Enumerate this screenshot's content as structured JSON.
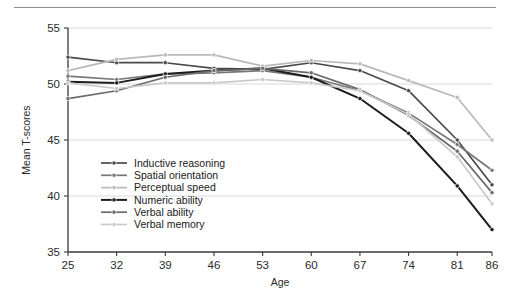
{
  "chart_data": {
    "type": "line",
    "title": "",
    "xlabel": "Age",
    "ylabel": "Mean T-scores",
    "x": [
      25,
      32,
      39,
      46,
      53,
      60,
      67,
      74,
      81,
      86
    ],
    "categories": [
      "25",
      "32",
      "39",
      "46",
      "53",
      "60",
      "67",
      "74",
      "81",
      "86"
    ],
    "xlim": [
      25,
      86
    ],
    "ylim": [
      35,
      55
    ],
    "yticks": [
      35,
      40,
      45,
      50,
      55
    ],
    "xticks": [
      "25",
      "32",
      "39",
      "46",
      "53",
      "60",
      "67",
      "74",
      "81",
      "86"
    ],
    "grid": "horizontal",
    "legend_position": "inside-lower-left",
    "series": [
      {
        "name": "Inductive reasoning",
        "color": "#4a4a4a",
        "values": [
          52.4,
          51.9,
          51.9,
          51.4,
          51.3,
          51.9,
          51.2,
          49.4,
          45.0,
          41.0
        ]
      },
      {
        "name": "Spatial orientation",
        "color": "#777777",
        "values": [
          50.7,
          50.4,
          50.9,
          51.0,
          51.2,
          50.6,
          49.4,
          47.4,
          44.6,
          42.3
        ]
      },
      {
        "name": "Perceptual speed",
        "color": "#b9b9b9",
        "values": [
          51.2,
          52.2,
          52.6,
          52.6,
          51.6,
          52.1,
          51.8,
          50.3,
          48.8,
          45.0
        ]
      },
      {
        "name": "Numeric ability",
        "color": "#1c1c1c",
        "values": [
          50.2,
          50.1,
          50.9,
          51.2,
          51.4,
          50.6,
          48.7,
          45.6,
          40.9,
          37.0
        ]
      },
      {
        "name": "Verbal ability",
        "color": "#6a6a6a",
        "values": [
          48.7,
          49.4,
          50.6,
          51.2,
          51.4,
          51.0,
          49.5,
          47.2,
          44.0,
          40.3
        ]
      },
      {
        "name": "Verbal memory",
        "color": "#c9c9c9",
        "values": [
          50.1,
          49.6,
          50.1,
          50.1,
          50.4,
          50.1,
          49.4,
          47.3,
          43.5,
          39.3
        ]
      }
    ]
  },
  "legend": {
    "items": [
      {
        "label": "Inductive reasoning"
      },
      {
        "label": "Spatial orientation"
      },
      {
        "label": "Perceptual speed"
      },
      {
        "label": "Numeric ability"
      },
      {
        "label": "Verbal ability"
      },
      {
        "label": "Verbal memory"
      }
    ]
  },
  "axes": {
    "y_label": "Mean T-scores",
    "x_label": "Age",
    "y_ticks": [
      "55",
      "50",
      "45",
      "40",
      "35"
    ],
    "x_ticks": [
      "25",
      "32",
      "39",
      "46",
      "53",
      "60",
      "67",
      "74",
      "81",
      "86"
    ]
  }
}
